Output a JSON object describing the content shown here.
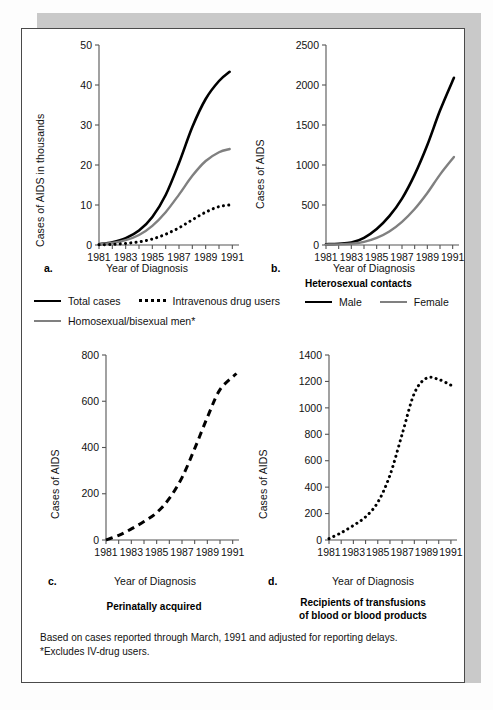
{
  "figure": {
    "footnote_line1": "Based on cases reported through March, 1991 and adjusted for reporting delays.",
    "footnote_line2": "*Excludes IV-drug users.",
    "axis_title_x": "Year of Diagnosis",
    "panel_labels": {
      "a": "a.",
      "b": "b.",
      "c": "c.",
      "d": "d."
    }
  },
  "legend_main": {
    "items": [
      {
        "label": "Total cases",
        "style": "solid-black"
      },
      {
        "label": "Intravenous drug users",
        "style": "dotted-black"
      },
      {
        "label": "Homosexual/bisexual men*",
        "style": "solid-gray"
      }
    ]
  },
  "legend_hetero": {
    "title": "Heterosexual contacts",
    "items": [
      {
        "label": "Male",
        "style": "solid-black"
      },
      {
        "label": "Female",
        "style": "solid-gray"
      }
    ]
  },
  "captions": {
    "c": "Perinatally acquired",
    "d_line1": "Recipients of transfusions",
    "d_line2": "of blood or blood products"
  },
  "colors": {
    "black": "#000000",
    "gray": "#808080",
    "axis": "#555555",
    "page": "#ffffff",
    "shadow": "#c9c9c9"
  },
  "chart_data": [
    {
      "id": "a",
      "type": "line",
      "title": "",
      "xlabel": "Year of Diagnosis",
      "ylabel": "Cases of AIDS in thousands",
      "xlim": [
        1981,
        1991.5
      ],
      "ylim": [
        0,
        50
      ],
      "yticks": [
        0,
        10,
        20,
        30,
        40,
        50
      ],
      "xticks": [
        1981,
        1982,
        1983,
        1984,
        1985,
        1986,
        1987,
        1988,
        1989,
        1990,
        1991
      ],
      "xticklabels": [
        "1981",
        "",
        "1983",
        "",
        "1985",
        "",
        "1987",
        "",
        "1989",
        "",
        "1991"
      ],
      "grid": false,
      "legend_position": "below-figure",
      "x": [
        1981,
        1982,
        1983,
        1984,
        1985,
        1986,
        1987,
        1988,
        1989,
        1990,
        1990.8
      ],
      "series": [
        {
          "name": "Total cases",
          "style": "solid-black",
          "values": [
            0.2,
            0.7,
            1.7,
            3.6,
            7.0,
            12.5,
            20.5,
            29.5,
            36.5,
            41.0,
            43.3
          ]
        },
        {
          "name": "Homosexual/bisexual men*",
          "style": "solid-gray",
          "values": [
            0.15,
            0.5,
            1.2,
            2.5,
            4.8,
            8.2,
            12.6,
            17.3,
            21.0,
            23.2,
            24.0
          ]
        },
        {
          "name": "Intravenous drug users",
          "style": "dotted-black",
          "values": [
            0.05,
            0.15,
            0.4,
            0.8,
            1.5,
            2.7,
            4.3,
            6.3,
            8.2,
            9.6,
            10.0
          ]
        }
      ]
    },
    {
      "id": "b",
      "type": "line",
      "title": "Heterosexual contacts",
      "xlabel": "Year of Diagnosis",
      "ylabel": "Cases of AIDS",
      "xlim": [
        1981,
        1991.5
      ],
      "ylim": [
        0,
        2500
      ],
      "yticks": [
        0,
        500,
        1000,
        1500,
        2000,
        2500
      ],
      "xticks": [
        1981,
        1982,
        1983,
        1984,
        1985,
        1986,
        1987,
        1988,
        1989,
        1990,
        1991
      ],
      "xticklabels": [
        "1981",
        "",
        "1983",
        "",
        "1985",
        "",
        "1987",
        "",
        "1989",
        "",
        "1991"
      ],
      "grid": false,
      "legend_position": "below-figure",
      "x": [
        1981,
        1982,
        1983,
        1984,
        1985,
        1986,
        1987,
        1988,
        1989,
        1990,
        1991.1
      ],
      "series": [
        {
          "name": "Male",
          "style": "solid-black",
          "values": [
            10,
            15,
            30,
            90,
            200,
            360,
            580,
            880,
            1250,
            1680,
            2090
          ]
        },
        {
          "name": "Female",
          "style": "solid-gray",
          "values": [
            5,
            8,
            15,
            40,
            90,
            170,
            290,
            450,
            650,
            880,
            1100
          ]
        }
      ]
    },
    {
      "id": "c",
      "type": "line",
      "title": "Perinatally acquired",
      "xlabel": "Year of Diagnosis",
      "ylabel": "Cases of AIDS",
      "xlim": [
        1981,
        1991.5
      ],
      "ylim": [
        0,
        800
      ],
      "yticks": [
        0,
        200,
        400,
        600,
        800
      ],
      "xticks": [
        1981,
        1982,
        1983,
        1984,
        1985,
        1986,
        1987,
        1988,
        1989,
        1990,
        1991
      ],
      "xticklabels": [
        "1981",
        "",
        "1983",
        "",
        "1985",
        "",
        "1987",
        "",
        "1989",
        "",
        "1991"
      ],
      "grid": false,
      "legend_position": "none",
      "x": [
        1981,
        1982,
        1983,
        1984,
        1985,
        1986,
        1987,
        1988,
        1989,
        1990,
        1991.3
      ],
      "series": [
        {
          "name": "Perinatally acquired",
          "style": "dashed-black",
          "values": [
            0,
            20,
            48,
            80,
            118,
            180,
            270,
            395,
            530,
            650,
            720
          ]
        }
      ]
    },
    {
      "id": "d",
      "type": "line",
      "title": "Recipients of transfusions of blood or blood products",
      "xlabel": "Year of Diagnosis",
      "ylabel": "Cases of AIDS",
      "xlim": [
        1981,
        1991.5
      ],
      "ylim": [
        0,
        1400
      ],
      "yticks": [
        0,
        200,
        400,
        600,
        800,
        1000,
        1200,
        1400
      ],
      "xticks": [
        1981,
        1982,
        1983,
        1984,
        1985,
        1986,
        1987,
        1988,
        1989,
        1990,
        1991
      ],
      "xticklabels": [
        "1981",
        "",
        "1983",
        "",
        "1985",
        "",
        "1987",
        "",
        "1989",
        "",
        "1991"
      ],
      "grid": false,
      "legend_position": "none",
      "x": [
        1981,
        1982,
        1983,
        1984,
        1985,
        1986,
        1987,
        1988,
        1989,
        1990,
        1991
      ],
      "series": [
        {
          "name": "Recipients of transfusions",
          "style": "dotted-black",
          "values": [
            10,
            55,
            110,
            175,
            285,
            490,
            800,
            1110,
            1225,
            1215,
            1172
          ]
        }
      ]
    }
  ]
}
